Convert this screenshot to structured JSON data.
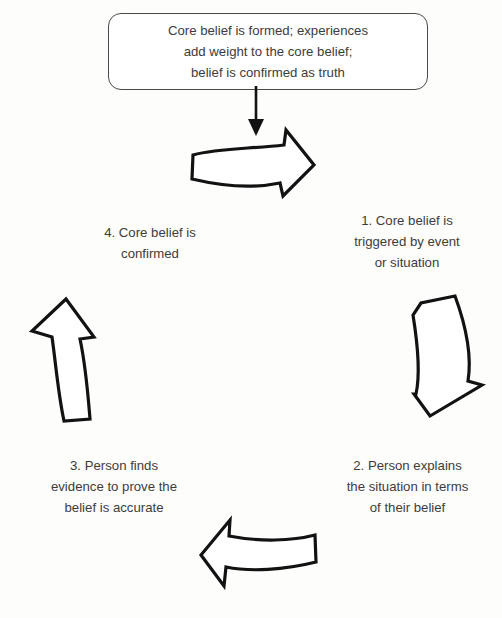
{
  "diagram": {
    "title_box": {
      "text": "Core belief is formed; experiences\nadd weight to the core belief;\nbelief is confirmed as truth"
    },
    "steps": [
      {
        "id": "step-1",
        "label": "1. Core belief is\ntriggered by event\nor situation"
      },
      {
        "id": "step-2",
        "label": "2. Person explains\nthe situation in terms\nof their belief"
      },
      {
        "id": "step-3",
        "label": "3. Person finds\nevidence to prove the\nbelief is accurate"
      },
      {
        "id": "step-4",
        "label": "4. Core belief is\n      confirmed"
      }
    ],
    "arrows": [
      {
        "id": "arrow-top",
        "direction": "right"
      },
      {
        "id": "arrow-right",
        "direction": "down"
      },
      {
        "id": "arrow-bottom",
        "direction": "left"
      },
      {
        "id": "arrow-left",
        "direction": "up"
      }
    ],
    "connector": {
      "id": "connector-arrow",
      "direction": "down"
    },
    "colors": {
      "background": "#fdfdfc",
      "text": "#3c3c3c",
      "box_border": "#4a4a4a",
      "arrow_stroke": "#121212",
      "arrow_fill": "#ffffff"
    }
  }
}
